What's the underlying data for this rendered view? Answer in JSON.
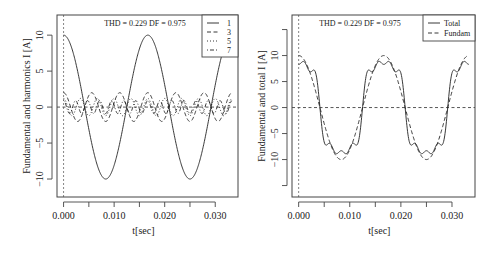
{
  "chart_data": [
    {
      "type": "line",
      "title": "",
      "annotation": "THD = 0.229 DF = 0.975",
      "xlabel": "t[sec]",
      "ylabel": "Fundamental and harmonics I [A]",
      "xlim": [
        -0.0013,
        0.0345
      ],
      "ylim": [
        -12.5,
        12.8
      ],
      "xticks": [
        0.0,
        0.005,
        0.01,
        0.015,
        0.02,
        0.025,
        0.03
      ],
      "xtick_labels": [
        "0.000",
        "",
        "0.010",
        "",
        "0.020",
        "",
        "0.030"
      ],
      "yticks": [
        -10,
        -5,
        0,
        5,
        10
      ],
      "ytick_labels": [
        "−10",
        "−5",
        "0",
        "5",
        "10"
      ],
      "grid": false,
      "reference_lines": {
        "vertical_x": 0,
        "horizontal_y": 0,
        "style": "dashed"
      },
      "legend": {
        "position": "top-right",
        "entries": [
          "1",
          "3",
          "5",
          "7"
        ]
      },
      "frequency_hz": 60,
      "t_range": [
        0,
        0.0333
      ],
      "series": [
        {
          "name": "1",
          "harmonic": 1,
          "amplitude": 10,
          "style": "solid"
        },
        {
          "name": "3",
          "harmonic": 3,
          "amplitude": 2.0,
          "style": "dashed"
        },
        {
          "name": "5",
          "harmonic": 5,
          "amplitude": 1.2,
          "style": "dotted"
        },
        {
          "name": "7",
          "harmonic": 7,
          "amplitude": 0.9,
          "style": "dotdash"
        }
      ]
    },
    {
      "type": "line",
      "title": "",
      "annotation": "THD = 0.229 DF = 0.975",
      "xlabel": "t[sec]",
      "ylabel": "Fundamental and total I [A]",
      "xlim": [
        -0.0013,
        0.0345
      ],
      "ylim": [
        -17.2,
        17.8
      ],
      "xticks": [
        0.0,
        0.005,
        0.01,
        0.015,
        0.02,
        0.025,
        0.03
      ],
      "xtick_labels": [
        "0.000",
        "",
        "0.010",
        "",
        "0.020",
        "",
        "0.030"
      ],
      "yticks": [
        -15,
        -10,
        -5,
        0,
        5,
        10,
        15
      ],
      "ytick_labels": [
        "",
        "−10",
        "−5",
        "0",
        "5",
        "10",
        ""
      ],
      "grid": false,
      "reference_lines": {
        "vertical_x": 0,
        "horizontal_y": 0,
        "style": "dashed"
      },
      "legend": {
        "position": "top-right",
        "entries": [
          "Total",
          "Fundam"
        ]
      },
      "frequency_hz": 60,
      "t_range": [
        0,
        0.0333
      ],
      "series": [
        {
          "name": "Total",
          "style": "solid",
          "components": [
            [
              1,
              10
            ],
            [
              3,
              -2.0
            ],
            [
              5,
              1.2
            ],
            [
              7,
              -0.9
            ]
          ],
          "peak_approx": 13.5
        },
        {
          "name": "Fundam",
          "style": "dashed",
          "components": [
            [
              1,
              10
            ]
          ],
          "peak_approx": 10
        }
      ]
    }
  ]
}
